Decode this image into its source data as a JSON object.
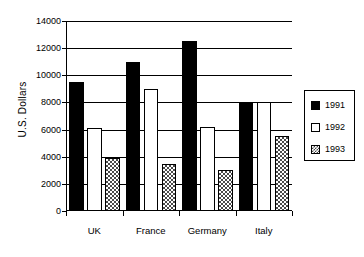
{
  "chart_data": {
    "type": "bar",
    "title": "",
    "subtitle": "",
    "xlabel": "",
    "ylabel": "U.S. Dollars",
    "categories": [
      "UK",
      "France",
      "Germany",
      "Italy"
    ],
    "series": [
      {
        "name": "1991",
        "values": [
          9500,
          11000,
          12500,
          8000
        ],
        "fill": "solid-black",
        "color": "#000000"
      },
      {
        "name": "1992",
        "values": [
          6100,
          9000,
          6200,
          8000
        ],
        "fill": "white",
        "color": "#ffffff"
      },
      {
        "name": "1993",
        "values": [
          3900,
          3500,
          3000,
          5500
        ],
        "fill": "checkered-gray",
        "color": "#4a4a4a"
      }
    ],
    "ylim": [
      0,
      14000
    ],
    "ytick_labels": [
      "0",
      "2000",
      "4000",
      "6000",
      "8000",
      "10000",
      "12000",
      "14000"
    ],
    "ytick_values": [
      0,
      2000,
      4000,
      6000,
      8000,
      10000,
      12000,
      14000
    ],
    "grid": "horizontal",
    "legend_position": "right",
    "legend_entries": [
      "1991",
      "1992",
      "1993"
    ]
  }
}
